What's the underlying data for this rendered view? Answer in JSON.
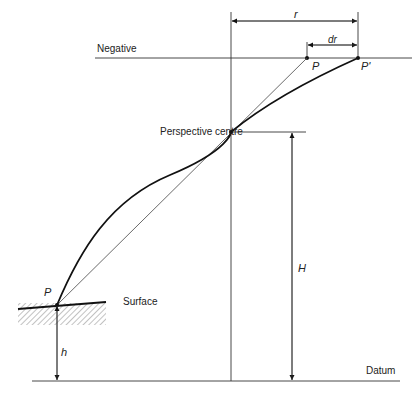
{
  "diagram": {
    "labels": {
      "negative": "Negative",
      "perspective_centre": "Perspective centre",
      "surface": "Surface",
      "datum": "Datum",
      "r": "r",
      "dr": "dr",
      "p_image": "P",
      "p_prime": "P'",
      "p_ground": "P",
      "flying_height": "H",
      "ground_height": "h"
    },
    "colors": {
      "line": "#111111",
      "thin_line": "#444444",
      "hatch": "#555555"
    }
  }
}
